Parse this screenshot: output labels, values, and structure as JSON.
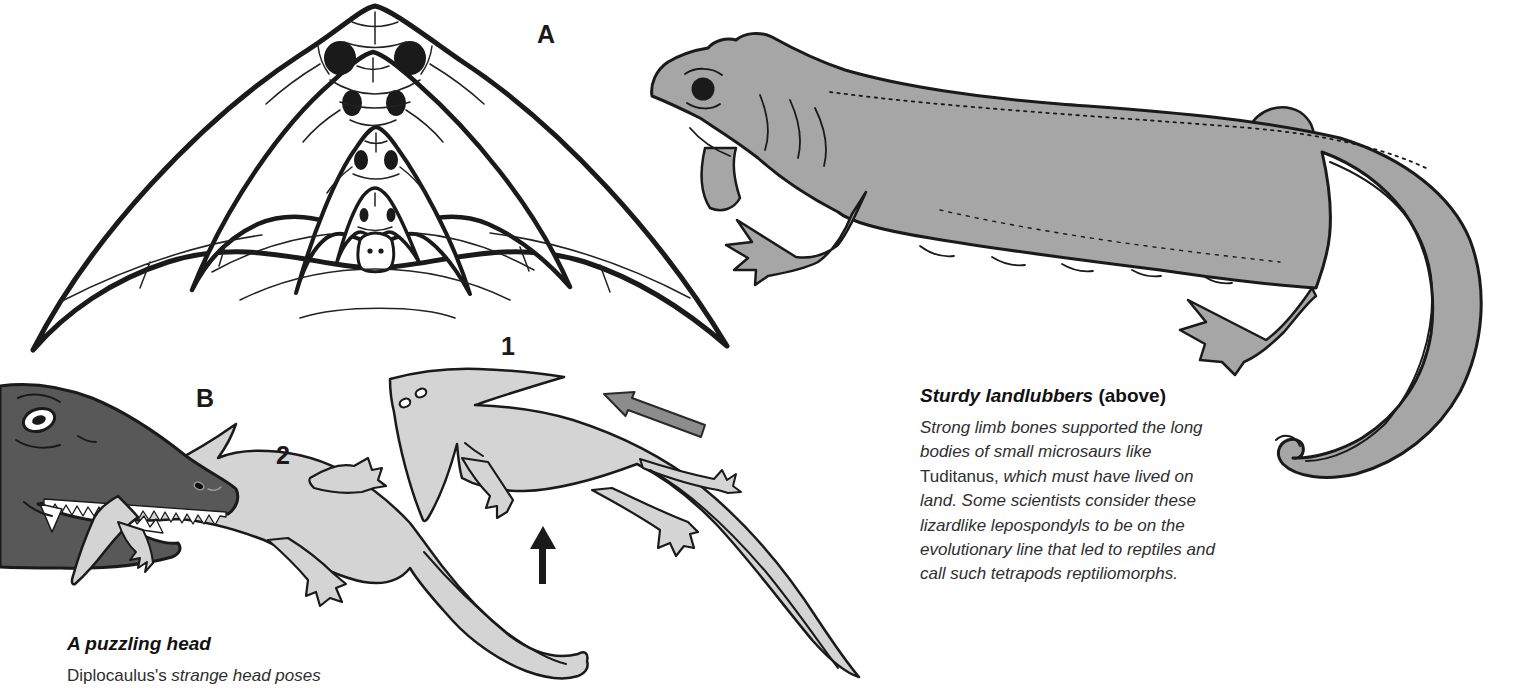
{
  "page_type": "book-illustration-page",
  "figure_labels": {
    "skull_diagram": "A",
    "predator_scene": "B",
    "swim_pose_1": "1",
    "swim_pose_2": "2"
  },
  "captions": {
    "sturdy": {
      "title": "Sturdy landlubbers",
      "note": " (above)",
      "lines": [
        [
          {
            "t": "Strong limb bones supported the long",
            "i": true
          }
        ],
        [
          {
            "t": "bodies of small microsaurs like",
            "i": true
          }
        ],
        [
          {
            "t": "Tuditanus,",
            "i": false
          },
          {
            "t": " which must have lived on",
            "i": true
          }
        ],
        [
          {
            "t": "land. Some scientists consider these",
            "i": true
          }
        ],
        [
          {
            "t": "lizardlike lepospondyls to be on the",
            "i": true
          }
        ],
        [
          {
            "t": "evolutionary line that led to reptiles and",
            "i": true
          }
        ],
        [
          {
            "t": "call such tetrapods reptiliomorphs.",
            "i": true
          }
        ]
      ]
    },
    "puzzling": {
      "title": "A puzzling head",
      "note": "",
      "lines": [
        [
          {
            "t": "Diplocaulus's",
            "i": false
          },
          {
            "t": " strange head poses",
            "i": true
          }
        ]
      ]
    }
  },
  "icons": {
    "flow_arrow": "thick-gray-arrow-pointing-upper-left",
    "lift_arrow": "thin-black-arrow-pointing-up"
  },
  "colors": {
    "paper": "#ffffff",
    "ink": "#1a1a1a",
    "tuditanus_gray": "#a6a6a6",
    "diplocaulus_gray": "#d4d4d4",
    "predator_gray": "#585858",
    "arrow_gray": "#8c8c8c",
    "caption_text": "#2e2e2e",
    "caption_title": "#111111"
  }
}
